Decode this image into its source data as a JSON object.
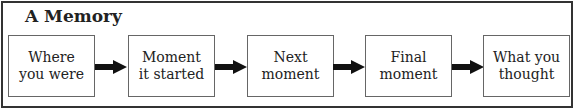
{
  "title": "A Memory",
  "steps": [
    {
      "label": "Where\nyou were"
    },
    {
      "label": "Moment\nit started"
    },
    {
      "label": "Next\nmoment"
    },
    {
      "label": "Final\nmoment"
    },
    {
      "label": "What you\nthought"
    }
  ],
  "colors": {
    "border": "#333333",
    "text": "#222222",
    "arrow": "#111111"
  }
}
